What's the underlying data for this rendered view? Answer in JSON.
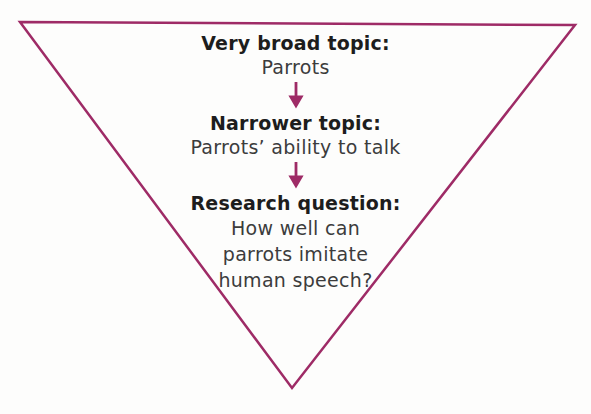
{
  "diagram": {
    "outline_color": "#9e2b66",
    "arrow_color": "#9e2b66",
    "levels": [
      {
        "heading": "Very broad topic:",
        "lines": [
          "Parrots"
        ]
      },
      {
        "heading": "Narrower topic:",
        "lines": [
          "Parrots’ ability to talk"
        ]
      },
      {
        "heading": "Research question:",
        "lines": [
          "How well can",
          "parrots imitate",
          "human speech?"
        ]
      }
    ]
  }
}
